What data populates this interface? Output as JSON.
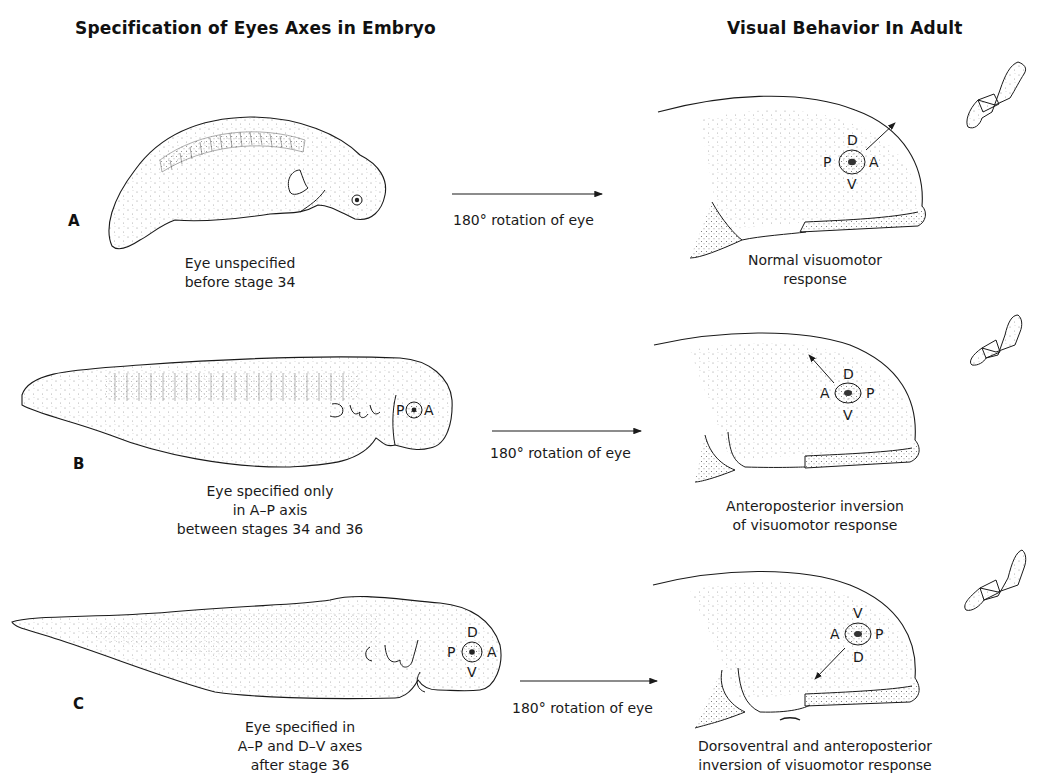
{
  "headings": {
    "left": "Specification of Eyes Axes in Embryo",
    "right": "Visual Behavior In Adult"
  },
  "rows": [
    {
      "label": "A",
      "embryo_caption": [
        "Eye unspecified",
        "before stage 34"
      ],
      "embryo_eye_axes": {
        "top": "",
        "left": "",
        "right": "",
        "bottom": ""
      },
      "arrow_label": "180° rotation of eye",
      "adult_eye_axes": {
        "top": "D",
        "left": "P",
        "right": "A",
        "bottom": "V"
      },
      "strike_direction": "up-forward",
      "adult_caption": [
        "Normal visuomotor",
        "response"
      ]
    },
    {
      "label": "B",
      "embryo_caption": [
        "Eye specified only",
        "in A–P axis",
        "between stages 34 and 36"
      ],
      "embryo_eye_axes": {
        "top": "",
        "left": "P",
        "right": "A",
        "bottom": ""
      },
      "arrow_label": "180° rotation of eye",
      "adult_eye_axes": {
        "top": "D",
        "left": "A",
        "right": "P",
        "bottom": "V"
      },
      "strike_direction": "up-backward",
      "adult_caption": [
        "Anteroposterior inversion",
        "of visuomotor response"
      ]
    },
    {
      "label": "C",
      "embryo_caption": [
        "Eye specified in",
        "A–P and D–V axes",
        "after stage 36"
      ],
      "embryo_eye_axes": {
        "top": "D",
        "left": "P",
        "right": "A",
        "bottom": "V"
      },
      "arrow_label": "180° rotation of eye",
      "adult_eye_axes": {
        "top": "V",
        "left": "A",
        "right": "P",
        "bottom": "D"
      },
      "strike_direction": "down-backward",
      "adult_caption": [
        "Dorsoventral and anteroposterior",
        "inversion of visuomotor response"
      ]
    }
  ],
  "colors": {
    "ink": "#1a1a1a",
    "stipple": "#8a8a8a",
    "background": "#ffffff"
  }
}
